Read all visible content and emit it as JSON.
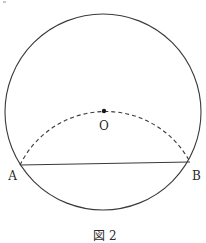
{
  "figure": {
    "caption": "図 2",
    "colors": {
      "stroke": "#3a3a3a",
      "background": "#ffffff"
    },
    "circle": {
      "cx": 103,
      "cy": 112,
      "r": 98
    },
    "points": [
      {
        "name": "A",
        "label": "A",
        "x": 20,
        "y": 165
      },
      {
        "name": "B",
        "label": "B",
        "x": 190,
        "y": 162
      },
      {
        "name": "O",
        "label": "O",
        "x": 104,
        "y": 111
      }
    ],
    "chord": {
      "from": "A",
      "to": "B"
    },
    "dashed_arc": {
      "from": "A",
      "through": "O",
      "to": "B",
      "style": "dashed"
    }
  }
}
